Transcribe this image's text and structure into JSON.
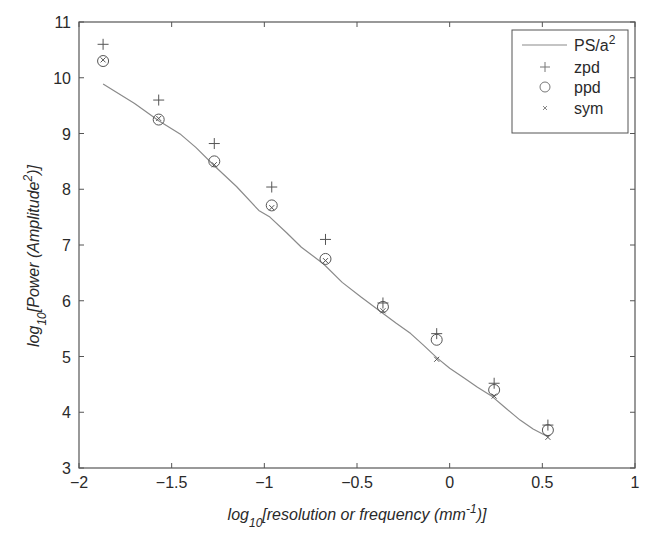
{
  "chart_data": {
    "type": "line",
    "title": "",
    "xlabel": "log10[resolution or frequency (mm^-1)]",
    "xlabel_parts": {
      "pre": "log",
      "sub": "10",
      "main": "[resolution or frequency (mm",
      "sup": "-1",
      "post": ")]"
    },
    "ylabel": "log10[Power (Amplitude^2)]",
    "ylabel_parts": {
      "pre": "log",
      "sub": "10",
      "main": "[Power (Amplitude",
      "sup": "2",
      "post": ")]"
    },
    "xlim": [
      -2,
      1
    ],
    "ylim": [
      3,
      11
    ],
    "xticks": [
      -2,
      -1.5,
      -1,
      -0.5,
      0,
      0.5,
      1
    ],
    "xtick_labels": [
      "−2",
      "−1.5",
      "−1",
      "−0.5",
      "0",
      "0.5",
      "1"
    ],
    "yticks": [
      3,
      4,
      5,
      6,
      7,
      8,
      9,
      10,
      11
    ],
    "ytick_labels": [
      "3",
      "4",
      "5",
      "6",
      "7",
      "8",
      "9",
      "10",
      "11"
    ],
    "grid": false,
    "legend_position": "upper right",
    "series": [
      {
        "name": "PS/a^2",
        "legend_label": "PS/a",
        "legend_sup": "2",
        "style": "line",
        "color": "#8a8a8a",
        "x": [
          -1.87,
          -1.7,
          -1.57,
          -1.45,
          -1.37,
          -1.27,
          -1.15,
          -1.03,
          -0.97,
          -0.88,
          -0.8,
          -0.68,
          -0.58,
          -0.48,
          -0.37,
          -0.29,
          -0.21,
          -0.14,
          -0.07,
          0.0,
          0.08,
          0.15,
          0.23,
          0.3,
          0.38,
          0.45,
          0.53
        ],
        "y": [
          9.89,
          9.54,
          9.23,
          8.98,
          8.75,
          8.42,
          8.05,
          7.62,
          7.5,
          7.22,
          6.96,
          6.66,
          6.33,
          6.07,
          5.8,
          5.6,
          5.41,
          5.2,
          4.98,
          4.79,
          4.61,
          4.45,
          4.28,
          4.08,
          3.86,
          3.7,
          3.56
        ]
      },
      {
        "name": "zpd",
        "legend_label": "zpd",
        "style": "plus",
        "color": "#555555",
        "x": [
          -1.87,
          -1.57,
          -1.27,
          -0.96,
          -0.67,
          -0.36,
          -0.07,
          0.24,
          0.53
        ],
        "y": [
          10.6,
          9.6,
          8.82,
          8.04,
          7.1,
          5.96,
          5.41,
          4.52,
          3.77
        ]
      },
      {
        "name": "ppd",
        "legend_label": "ppd",
        "style": "circle",
        "color": "#555555",
        "x": [
          -1.87,
          -1.57,
          -1.27,
          -0.96,
          -0.67,
          -0.36,
          -0.07,
          0.24,
          0.53
        ],
        "y": [
          10.3,
          9.25,
          8.5,
          7.71,
          6.75,
          5.89,
          5.3,
          4.4,
          3.68
        ]
      },
      {
        "name": "sym",
        "legend_label": "sym",
        "style": "x",
        "color": "#555555",
        "x": [
          -1.87,
          -1.57,
          -1.27,
          -0.96,
          -0.67,
          -0.36,
          -0.07,
          0.24,
          0.53
        ],
        "y": [
          10.32,
          9.27,
          8.44,
          7.67,
          6.72,
          5.82,
          4.95,
          4.29,
          3.55
        ]
      }
    ]
  }
}
